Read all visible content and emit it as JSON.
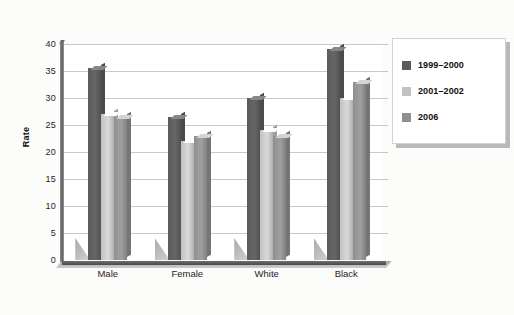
{
  "chart_data": {
    "type": "bar",
    "title": "",
    "xlabel": "",
    "ylabel": "Rate",
    "ylim": [
      0,
      40
    ],
    "yticks": [
      40,
      35,
      30,
      25,
      20,
      15,
      10,
      5,
      0
    ],
    "grid": true,
    "legend_position": "right",
    "categories": [
      "Male",
      "Female",
      "White",
      "Black"
    ],
    "series": [
      {
        "name": "1999–2000",
        "color": "#5b5b5b",
        "values": [
          35.5,
          26.5,
          30.0,
          39.0
        ]
      },
      {
        "name": "2001–2002",
        "color": "#c2c2c2",
        "values": [
          27.0,
          22.0,
          24.0,
          30.0
        ]
      },
      {
        "name": "2006",
        "color": "#8f8f8f",
        "values": [
          26.5,
          23.0,
          23.0,
          33.0
        ]
      }
    ]
  },
  "axes": {
    "y_title": "Rate"
  },
  "colors": {
    "background": "#fcfcfb",
    "plot_background": "#ffffff",
    "gridline": "#c9c9c9",
    "axis": "#5a5a5a",
    "text": "#1d1d1d"
  }
}
